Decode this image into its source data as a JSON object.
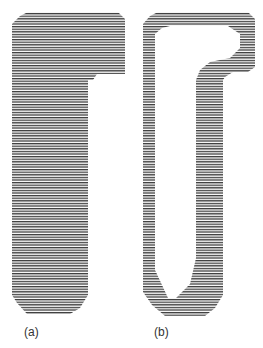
{
  "figure": {
    "panels": [
      {
        "id": "a",
        "label": "(a)",
        "description": "solid hatched region"
      },
      {
        "id": "b",
        "label": "(b)",
        "description": "hatched boundary band with hollow interior"
      }
    ],
    "colors": {
      "hatch": "#3a3a3a",
      "background": "#ffffff"
    }
  }
}
